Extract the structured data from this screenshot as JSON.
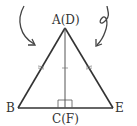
{
  "diagram": {
    "type": "geometry-triangle",
    "labels": {
      "apex": "A(D)",
      "left": "B",
      "foot": "C(F)",
      "right": "E"
    },
    "vertices": {
      "apex": [
        65,
        28
      ],
      "left": [
        18,
        108
      ],
      "foot": [
        65,
        108
      ],
      "right": [
        113,
        108
      ]
    },
    "marks": {
      "equal_sides_ticks": "AB = AE (double tick marks)",
      "altitude_tick": "single tick on AC",
      "right_angle": "at C(F)"
    },
    "arrows": {
      "left": "curved arrow pointing down-right toward triangle",
      "right": "curled arrow pointing down-left toward triangle"
    },
    "colors": {
      "stroke": "#333333",
      "background": "#ffffff"
    }
  }
}
